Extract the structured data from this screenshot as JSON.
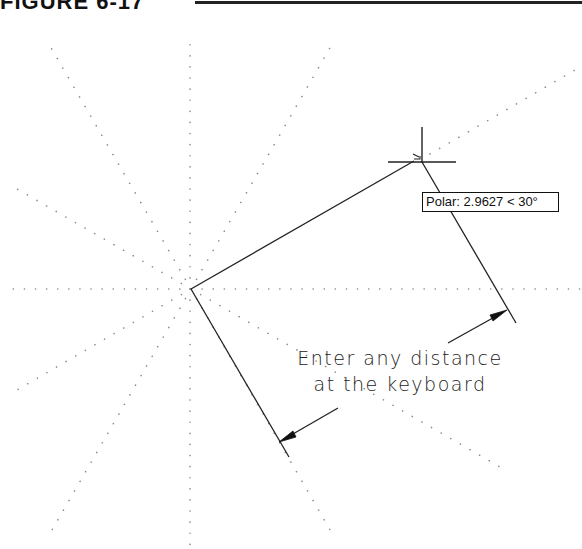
{
  "figure": {
    "title": "FIGURE 6-17"
  },
  "tooltip": {
    "label": "Polar: 2.9627 < 30°",
    "distance": "2.9627",
    "angle": "30°"
  },
  "annotation": {
    "line1": "Enter any distance",
    "line2": "at the keyboard"
  },
  "drawing": {
    "origin": [
      191,
      289
    ],
    "polar_tracking_rays_deg": [
      0,
      30,
      60,
      90,
      120,
      150,
      180,
      210,
      240,
      270,
      300,
      330
    ],
    "object_line": {
      "from": [
        191,
        289
      ],
      "to": [
        416,
        160
      ],
      "angle": "30°"
    },
    "cursor": {
      "crosshair_center": [
        422,
        162
      ]
    },
    "dimension": {
      "extension_left": {
        "from": [
          191,
          289
        ],
        "to": [
          289,
          457
        ]
      },
      "extension_right": {
        "from": [
          422,
          162
        ],
        "to": [
          516,
          323
        ]
      },
      "arrow_left_tip": [
        279,
        442
      ],
      "arrow_right_tip": [
        507,
        310
      ]
    },
    "colors": {
      "line": "#222222",
      "tracking_dots": "#888888",
      "background": "#ffffff"
    }
  }
}
